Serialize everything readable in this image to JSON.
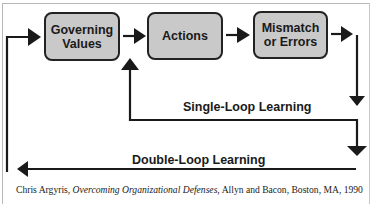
{
  "diagram": {
    "boxes": [
      {
        "id": "governing-values",
        "line1": "Governing",
        "line2": "Values"
      },
      {
        "id": "actions",
        "line1": "Actions"
      },
      {
        "id": "mismatch-or-errors",
        "line1": "Mismatch",
        "line2": "or Errors"
      }
    ],
    "loops": {
      "single": "Single-Loop Learning",
      "double": "Double-Loop Learning"
    },
    "colors": {
      "box_fill": "#c9c9c9",
      "stroke": "#1a1a1a"
    }
  },
  "citation": {
    "author": "Chris Argyris, ",
    "title": "Overcoming Organizational Defenses,",
    "rest": " Allyn and Bacon, Boston, MA, 1990"
  }
}
